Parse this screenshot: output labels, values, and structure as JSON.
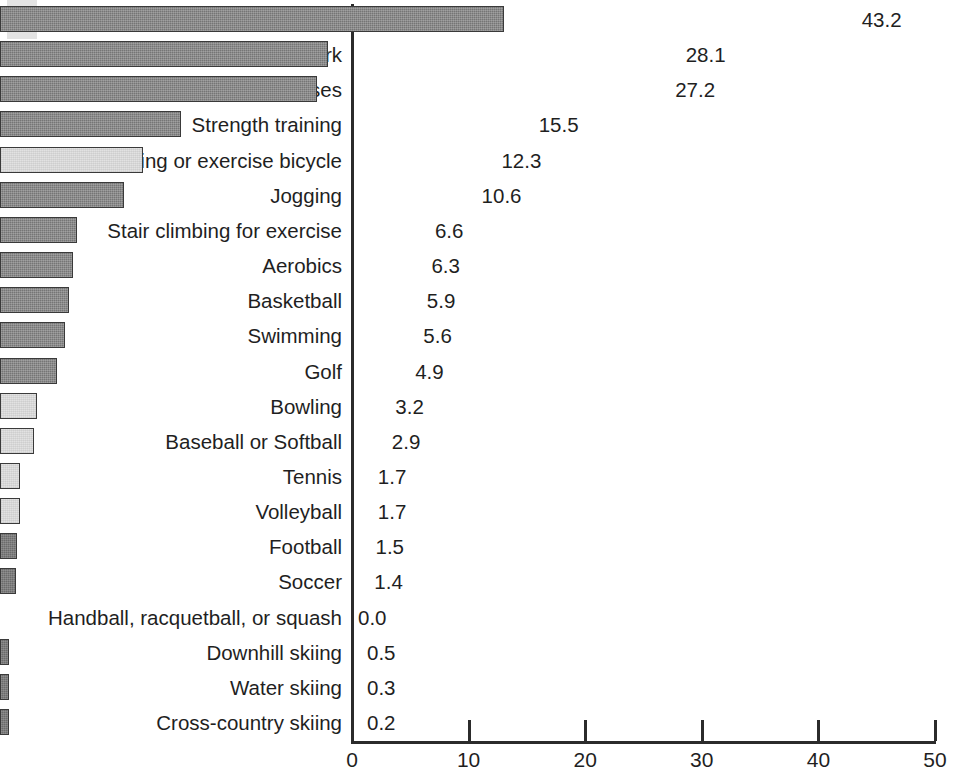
{
  "artifacts": {
    "edge_glyph": "e"
  },
  "chart_data": {
    "type": "bar",
    "orientation": "horizontal",
    "title": "",
    "subtitle": "",
    "xlabel": "",
    "ylabel": "",
    "xlim": [
      0,
      50
    ],
    "xticks": [
      0,
      10,
      20,
      30,
      40,
      50
    ],
    "xtick_labels": [
      "0",
      "10",
      "20",
      "30",
      "40",
      "50"
    ],
    "grid": false,
    "legend": false,
    "value_label_format": "one-decimal",
    "categories": [
      "Walking for exercise",
      "Gardening/yard work",
      "Stretching exercises",
      "Strength training",
      "Bicycling or exercise bicycle",
      "Jogging",
      "Stair climbing for exercise",
      "Aerobics",
      "Basketball",
      "Swimming",
      "Golf",
      "Bowling",
      "Baseball or Softball",
      "Tennis",
      "Volleyball",
      "Football",
      "Soccer",
      "Handball, racquetball, or squash",
      "Downhill skiing",
      "Water skiing",
      "Cross-country skiing"
    ],
    "values": [
      43.2,
      28.1,
      27.2,
      15.5,
      12.3,
      10.6,
      6.6,
      6.3,
      5.9,
      5.6,
      4.9,
      3.2,
      2.9,
      1.7,
      1.7,
      1.5,
      1.4,
      0.0,
      0.5,
      0.3,
      0.2
    ],
    "value_labels": [
      "43.2",
      "28.1",
      "27.2",
      "15.5",
      "12.3",
      "10.6",
      "6.6",
      "6.3",
      "5.9",
      "5.6",
      "4.9",
      "3.2",
      "2.9",
      "1.7",
      "1.7",
      "1.5",
      "1.4",
      "0.0",
      "0.5",
      "0.3",
      "0.2"
    ],
    "bar_styles": [
      "dark",
      "dark",
      "dark",
      "dark",
      "light",
      "dark",
      "dark",
      "dark",
      "dark",
      "dark",
      "dark",
      "light",
      "light",
      "light",
      "light",
      "darker",
      "darker",
      "none",
      "darker",
      "darker",
      "darker"
    ],
    "colors": {
      "dark_fill": "#757575",
      "darker_fill": "#6b6b6b",
      "light_fill": "#e2e2e2",
      "bar_outline": "#3a3a3a",
      "axis": "#2b2b2b",
      "text": "#1f1f1f",
      "background": "#ffffff"
    }
  }
}
